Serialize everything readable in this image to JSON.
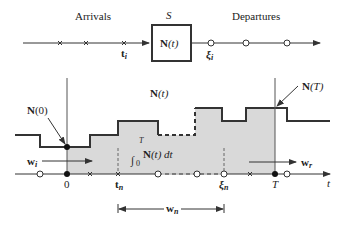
{
  "top": {
    "arrivals_label": "Arrivals",
    "system_label": "S",
    "box_label_bold": "N",
    "box_label_rest": "(t)",
    "departures_label": "Departures",
    "arrival_time_label": "t",
    "arrival_time_sub": "i",
    "departure_time_label": "ξ",
    "departure_time_sub": "i"
  },
  "plot": {
    "curve_label_bold": "N",
    "curve_label_rest": "(t)",
    "n0_label_bold": "N",
    "n0_label_rest": "(0)",
    "nT_label_bold": "N",
    "nT_label_rest": "(T)",
    "integral_upper": "T",
    "integral_lower": "0",
    "integrand_bold": "N",
    "integrand_rest": "(t) dt",
    "wi_label": "w",
    "wi_sub": "i",
    "wr_label": "w",
    "wr_sub": "r",
    "wn_label": "w",
    "wn_sub": "n",
    "axis_label": "t",
    "tick_zero": "0",
    "tick_tn": "t",
    "tick_tn_sub": "n",
    "tick_xin": "ξ",
    "tick_xin_sub": "n",
    "tick_T": "T"
  },
  "colors": {
    "line": "#333333",
    "fill": "#d9d9d9",
    "text": "#222222"
  }
}
